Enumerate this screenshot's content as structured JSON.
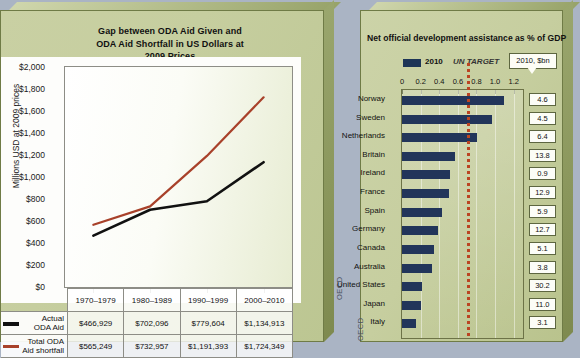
{
  "left_panel": {
    "title": "Gap between ODA Aid Given and ODA Aid Shortfall in US Dollars at 2009 Prices",
    "title_lines": [
      "Gap between ODA Aid Given and",
      "ODA Aid Shortfall in US Dollars at",
      "2009 Prices"
    ],
    "source_label": "OECD",
    "legend": [
      {
        "name": "Actual ODA Aid",
        "line1": "Actual",
        "line2": "ODA Aid",
        "color": "#111111"
      },
      {
        "name": "Total ODA Aid shortfall",
        "line1": "Total ODA",
        "line2": "Aid shortfall",
        "color": "#a8412a"
      }
    ]
  },
  "right_panel": {
    "title": "Net official development assistance as % of GDP",
    "legend_year": "2010",
    "legend_target": "UN TARGET",
    "callout": "2010, $bn",
    "source_label": "OECD",
    "bar_color": "#22355a",
    "target_color": "#bb4422"
  },
  "chart_data": [
    {
      "type": "line",
      "title": "Gap between ODA Aid Given and ODA Aid Shortfall in US Dollars at 2009 Prices",
      "xlabel": "",
      "ylabel": "Millions USD at 2009 prices",
      "categories": [
        "1970–1979",
        "1980–1989",
        "1990–1999",
        "2000–2010"
      ],
      "ylim": [
        0,
        2000
      ],
      "yticks": [
        0,
        200,
        400,
        600,
        800,
        1000,
        1200,
        1400,
        1600,
        1800,
        2000
      ],
      "ytick_labels": [
        "$0",
        "$200",
        "$400",
        "$600",
        "$800",
        "$1,000",
        "$1,200",
        "$1,400",
        "$1,600",
        "$1,800",
        "$2,000"
      ],
      "grid": false,
      "legend_position": "bottom-left",
      "series": [
        {
          "name": "Actual ODA Aid",
          "color": "#111111",
          "values": [
            466.929,
            702.096,
            779.604,
            1134.913
          ],
          "value_labels": [
            "$466,929",
            "$702,096",
            "$779,604",
            "$1,134,913"
          ]
        },
        {
          "name": "Total ODA Aid shortfall",
          "color": "#a8412a",
          "values": [
            565.249,
            732.957,
            1191.393,
            1724.349
          ],
          "value_labels": [
            "$565,249",
            "$732,957",
            "$1,191,393",
            "$1,724,349"
          ]
        }
      ]
    },
    {
      "type": "bar",
      "orientation": "horizontal",
      "title": "Net official development assistance as % of GDP",
      "xlabel": "",
      "ylabel": "",
      "xlim": [
        0,
        1.3
      ],
      "xticks": [
        0,
        0.2,
        0.4,
        0.6,
        0.8,
        1.0,
        1.2
      ],
      "xtick_labels": [
        "0",
        "0.2",
        "0.4",
        "0.6",
        "0.8",
        "1.0",
        "1.2"
      ],
      "grid": true,
      "legend_position": "top",
      "series_name": "2010",
      "annotation": {
        "label": "UN TARGET",
        "value": 0.7,
        "style": "dotted-vertical"
      },
      "value_column_header": "2010, $bn",
      "categories": [
        "Norway",
        "Sweden",
        "Netherlands",
        "Britain",
        "Ireland",
        "France",
        "Spain",
        "Germany",
        "Canada",
        "Australia",
        "United States",
        "Japan",
        "Italy"
      ],
      "values": [
        1.1,
        0.97,
        0.81,
        0.57,
        0.52,
        0.5,
        0.43,
        0.39,
        0.34,
        0.32,
        0.21,
        0.2,
        0.15
      ],
      "value_labels": [
        "4.6",
        "4.5",
        "6.4",
        "13.8",
        "0.9",
        "12.9",
        "5.9",
        "12.7",
        "5.1",
        "3.8",
        "30.2",
        "11.0",
        "3.1"
      ]
    }
  ]
}
